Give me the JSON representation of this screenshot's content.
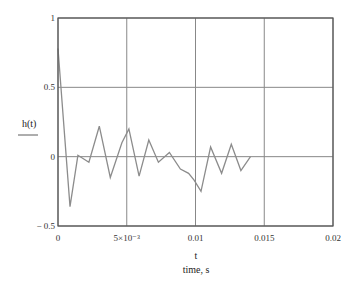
{
  "chart_data": {
    "type": "line",
    "title": "",
    "xlabel": "t",
    "xlabel_sub": "time, s",
    "ylabel": "h(t)",
    "xlim": [
      0,
      0.02
    ],
    "ylim": [
      -0.5,
      1
    ],
    "grid": true,
    "legend": null,
    "x_ticks": [
      {
        "value": 0,
        "label": "0"
      },
      {
        "value": 0.005,
        "label": "5×10⁻³"
      },
      {
        "value": 0.01,
        "label": "0.01"
      },
      {
        "value": 0.015,
        "label": "0.015"
      },
      {
        "value": 0.02,
        "label": "0.02"
      }
    ],
    "y_ticks": [
      {
        "value": -0.5,
        "label": "− 0.5"
      },
      {
        "value": 0,
        "label": "0"
      },
      {
        "value": 0.5,
        "label": "0.5"
      },
      {
        "value": 1,
        "label": "1"
      }
    ],
    "series": [
      {
        "name": "h(t)",
        "color": "#8c8c8c",
        "x": [
          0,
          0.00087,
          0.00145,
          0.00225,
          0.003,
          0.0038,
          0.00465,
          0.00516,
          0.0059,
          0.0066,
          0.0073,
          0.0081,
          0.0089,
          0.0095,
          0.0099,
          0.0104,
          0.0111,
          0.0119,
          0.0126,
          0.0133,
          0.014
        ],
        "y": [
          0.78,
          -0.36,
          0.01,
          -0.04,
          0.22,
          -0.15,
          0.1,
          0.2,
          -0.14,
          0.12,
          -0.04,
          0.03,
          -0.09,
          -0.12,
          -0.17,
          -0.25,
          0.07,
          -0.12,
          0.09,
          -0.1,
          0.0
        ]
      }
    ]
  }
}
